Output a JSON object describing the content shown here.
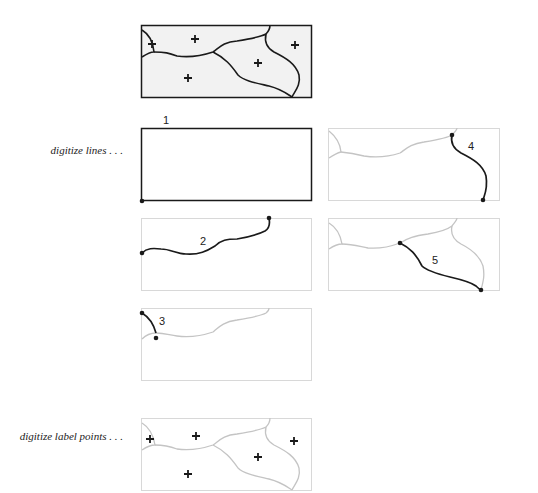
{
  "labels": {
    "digitize_lines": "digitize lines . . .",
    "digitize_label_points": "digitize label points . . ."
  },
  "steps": {
    "s1": "1",
    "s2": "2",
    "s3": "3",
    "s4": "4",
    "s5": "5"
  },
  "colors": {
    "active_line": "#1a1a1a",
    "inactive_line": "#c4c4c4",
    "frame_gray": "#d8d8d8",
    "polygon_fill": "#f2f2f2"
  }
}
